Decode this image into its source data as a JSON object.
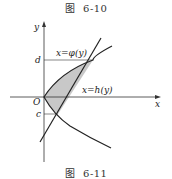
{
  "captions": {
    "top": {
      "prefix": "图",
      "number": "6-10"
    },
    "bottom": {
      "prefix": "图",
      "number": "6-11"
    }
  },
  "diagram": {
    "axes": {
      "x_label": "x",
      "y_label": "y",
      "origin_label": "O"
    },
    "levels": {
      "upper": "d",
      "lower": "c"
    },
    "curves": {
      "phi": {
        "label": "x=φ(y)",
        "description": "parabola opening right, through origin"
      },
      "h": {
        "label": "x=h(y)",
        "description": "straight line"
      }
    },
    "region": {
      "fill": "#c8c8c8",
      "description": "shaded region between x=φ(y) and x=h(y) for c ≤ y ≤ d"
    },
    "colors": {
      "stroke": "#222222",
      "thin_stroke": "#555555"
    }
  }
}
